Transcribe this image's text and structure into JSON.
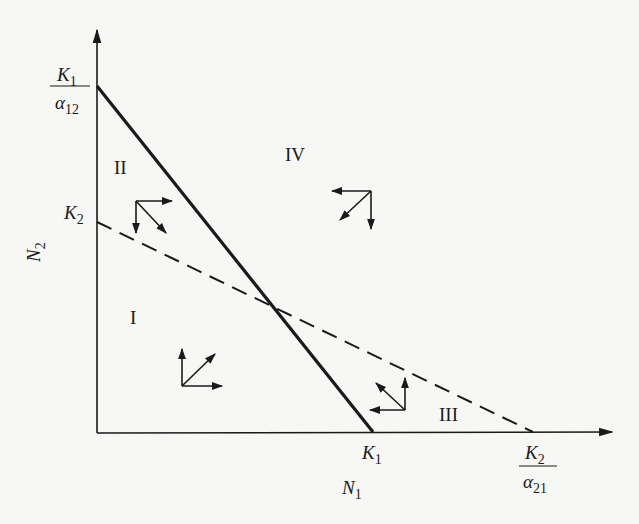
{
  "diagram": {
    "type": "phase-plane",
    "colors": {
      "ink": "#1a1a1a",
      "background": "#f7f7f5"
    },
    "axes": {
      "x": {
        "label_main": "N",
        "label_sub": "1"
      },
      "y": {
        "label_main": "N",
        "label_sub": "2"
      }
    },
    "intercepts": {
      "y_solid": {
        "num_main": "K",
        "num_sub": "1",
        "den_main": "α",
        "den_sub": "12"
      },
      "y_dashed": {
        "main": "K",
        "sub": "2"
      },
      "x_solid": {
        "main": "K",
        "sub": "1"
      },
      "x_dashed": {
        "num_main": "K",
        "num_sub": "2",
        "den_main": "α",
        "den_sub": "21"
      }
    },
    "lines": [
      {
        "name": "N1-isocline",
        "style": "solid",
        "from": "K1/α12 on N2 axis",
        "to": "K1 on N1 axis"
      },
      {
        "name": "N2-isocline",
        "style": "dashed",
        "from": "K2 on N2 axis",
        "to": "K2/α21 on N1 axis"
      }
    ],
    "regions": [
      {
        "id": "I",
        "label": "I",
        "arrows": [
          "N1 increases (right)",
          "N2 increases (up)",
          "resultant up-right"
        ]
      },
      {
        "id": "II",
        "label": "II",
        "arrows": [
          "N1 increases (right)",
          "N2 decreases (down)",
          "resultant down-right"
        ]
      },
      {
        "id": "III",
        "label": "III",
        "arrows": [
          "N1 decreases (left)",
          "N2 increases (up)",
          "resultant up-left"
        ]
      },
      {
        "id": "IV",
        "label": "IV",
        "arrows": [
          "N1 decreases (left)",
          "N2 decreases (down)",
          "resultant down-left"
        ]
      }
    ]
  }
}
